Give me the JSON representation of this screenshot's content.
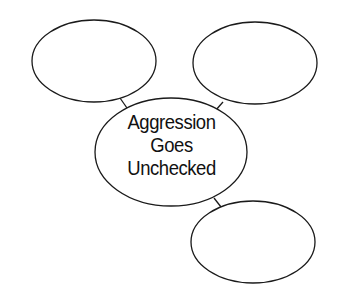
{
  "diagram": {
    "type": "concept-web",
    "center": {
      "lines": [
        "Aggression",
        "Goes",
        "Unchecked"
      ]
    },
    "nodes": [
      {
        "id": "top-left",
        "text": ""
      },
      {
        "id": "top-right",
        "text": ""
      },
      {
        "id": "bottom-right",
        "text": ""
      }
    ],
    "colors": {
      "stroke": "#1a1a1a",
      "fill": "#ffffff",
      "text": "#111111",
      "background": "#ffffff"
    }
  }
}
